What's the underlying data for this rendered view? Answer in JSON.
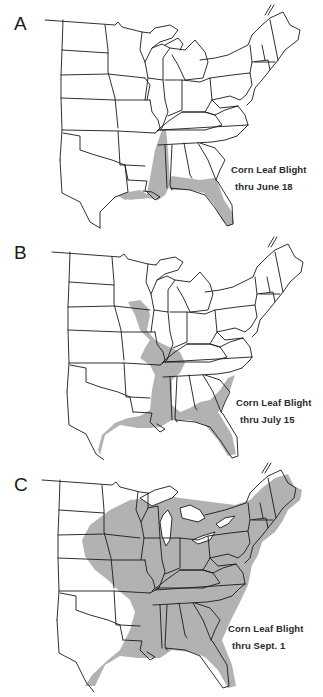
{
  "figure": {
    "panels": [
      {
        "letter": "A",
        "caption_line1": "Corn Leaf Blight",
        "caption_line2": "thru June 18",
        "affected_region": [
          "Louisiana",
          "Mississippi (west)",
          "Florida",
          "southern Alabama/Georgia coast"
        ]
      },
      {
        "letter": "B",
        "caption_line1": "Corn Leaf Blight",
        "caption_line2": "thru July 15",
        "affected_region": [
          "Iowa (east)",
          "Illinois (west)",
          "Missouri (east)",
          "Kentucky (west)",
          "Tennessee",
          "Mississippi",
          "Louisiana",
          "Texas coast",
          "Florida",
          "Georgia/S. Carolina coast",
          "Alabama (south/east)"
        ]
      },
      {
        "letter": "C",
        "caption_line1": "Corn Leaf Blight",
        "caption_line2": "thru Sept. 1",
        "affected_region": [
          "Nearly all states east of the Great Plains",
          "eastern Nebraska/Kansas",
          "eastern Oklahoma",
          "east Texas"
        ]
      }
    ],
    "colors": {
      "shade": "#b2b2b2",
      "outline": "#1a1a1a",
      "background": "#ffffff"
    }
  }
}
